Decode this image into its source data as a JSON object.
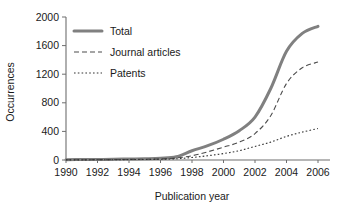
{
  "chart_data": {
    "type": "line",
    "title": "",
    "xlabel": "Publication year",
    "ylabel": "Occurrences",
    "x": [
      1990,
      1991,
      1992,
      1993,
      1994,
      1995,
      1996,
      1997,
      1998,
      1999,
      2000,
      2001,
      2002,
      2003,
      2004,
      2005,
      2006
    ],
    "xtick_labels": [
      "1990",
      "1992",
      "1994",
      "1996",
      "1998",
      "2000",
      "2002",
      "2004",
      "2006"
    ],
    "xticks": [
      1990,
      1992,
      1994,
      1996,
      1998,
      2000,
      2002,
      2004,
      2006
    ],
    "xlim": [
      1990,
      2006
    ],
    "ytick_labels": [
      "0",
      "400",
      "800",
      "1200",
      "1600",
      "2000"
    ],
    "yticks": [
      0,
      400,
      800,
      1200,
      1600,
      2000
    ],
    "ylim": [
      0,
      2000
    ],
    "grid": false,
    "legend_position": "upper left inside",
    "series": [
      {
        "name": "Total",
        "style": "solid",
        "color": "#808080",
        "width": 3.0,
        "values": [
          5,
          6,
          8,
          10,
          14,
          18,
          25,
          45,
          130,
          200,
          290,
          410,
          600,
          1000,
          1520,
          1770,
          1870
        ]
      },
      {
        "name": "Journal articles",
        "style": "dashed",
        "color": "#4d4d4d",
        "width": 1.1,
        "values": [
          3,
          4,
          5,
          6,
          8,
          11,
          15,
          28,
          60,
          115,
          180,
          250,
          370,
          620,
          1070,
          1290,
          1370
        ]
      },
      {
        "name": "Patents",
        "style": "dotted",
        "color": "#333333",
        "width": 1.1,
        "values": [
          2,
          2,
          3,
          4,
          6,
          7,
          10,
          17,
          35,
          60,
          90,
          130,
          190,
          250,
          330,
          390,
          440
        ]
      }
    ]
  },
  "legend": {
    "items": [
      {
        "label": "Total"
      },
      {
        "label": "Journal articles"
      },
      {
        "label": "Patents"
      }
    ]
  },
  "axes": {
    "y_title": "Occurrences",
    "x_title": "Publication year"
  }
}
